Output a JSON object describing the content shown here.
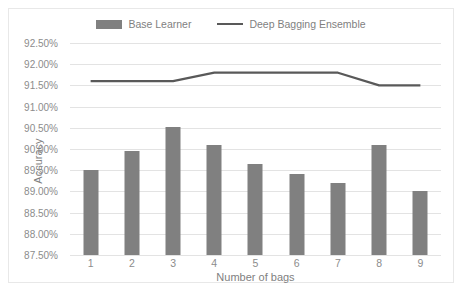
{
  "chart_data": {
    "type": "bar",
    "title": "",
    "xlabel": "Number of bags",
    "ylabel": "Accuracy",
    "categories": [
      "1",
      "2",
      "3",
      "4",
      "5",
      "6",
      "7",
      "8",
      "9"
    ],
    "ylim": [
      87.5,
      92.5
    ],
    "ytick_step": 0.5,
    "ytick_labels": [
      "92.50%",
      "92.00%",
      "91.50%",
      "91.00%",
      "90.50%",
      "90.00%",
      "89.50%",
      "89.00%",
      "88.50%",
      "88.00%",
      "87.50%"
    ],
    "ytick_values": [
      92.5,
      92.0,
      91.5,
      91.0,
      90.5,
      90.0,
      89.5,
      89.0,
      88.5,
      88.0,
      87.5
    ],
    "grid": true,
    "legend_position": "top-center",
    "series": [
      {
        "name": "Base Learner",
        "type": "bar",
        "color": "#808080",
        "values": [
          89.5,
          89.95,
          90.52,
          90.1,
          89.65,
          89.4,
          89.2,
          90.1,
          89.0
        ]
      },
      {
        "name": "Deep Bagging Ensemble",
        "type": "line",
        "color": "#595959",
        "values": [
          91.6,
          91.6,
          91.6,
          91.8,
          91.8,
          91.8,
          91.8,
          91.5,
          91.5
        ]
      }
    ]
  },
  "legend": {
    "items": [
      {
        "label": "Base Learner",
        "marker": "bar-swatch",
        "color": "#808080"
      },
      {
        "label": "Deep Bagging Ensemble",
        "marker": "line-swatch",
        "color": "#595959"
      }
    ]
  },
  "axes": {
    "x_title": "Number of bags",
    "y_title": "Accuracy"
  }
}
